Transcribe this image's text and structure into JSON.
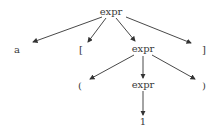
{
  "diagram": {
    "type": "parse-tree",
    "nodes": [
      {
        "id": "n0",
        "label": "expr",
        "x": 111,
        "y": 12
      },
      {
        "id": "n1",
        "label": "a",
        "x": 17,
        "y": 50
      },
      {
        "id": "n2",
        "label": "[",
        "x": 81,
        "y": 50
      },
      {
        "id": "n3",
        "label": "expr",
        "x": 143,
        "y": 49
      },
      {
        "id": "n4",
        "label": "]",
        "x": 204,
        "y": 50
      },
      {
        "id": "n5",
        "label": "(",
        "x": 80,
        "y": 86
      },
      {
        "id": "n6",
        "label": "expr",
        "x": 143,
        "y": 85
      },
      {
        "id": "n7",
        "label": ")",
        "x": 204,
        "y": 86
      },
      {
        "id": "n8",
        "label": "1",
        "x": 143,
        "y": 122
      }
    ],
    "edges": [
      {
        "from": "n0",
        "to": "n1"
      },
      {
        "from": "n0",
        "to": "n2"
      },
      {
        "from": "n0",
        "to": "n3"
      },
      {
        "from": "n0",
        "to": "n4"
      },
      {
        "from": "n3",
        "to": "n5"
      },
      {
        "from": "n3",
        "to": "n6"
      },
      {
        "from": "n3",
        "to": "n7"
      },
      {
        "from": "n6",
        "to": "n8"
      }
    ]
  }
}
